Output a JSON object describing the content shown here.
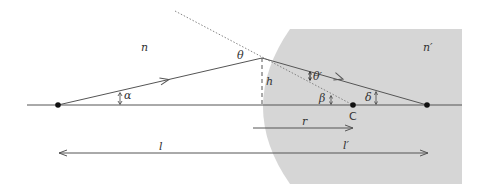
{
  "diagram": {
    "colors": {
      "background": "#ffffff",
      "medium2_fill": "#d6d6d6",
      "line": "#555555",
      "point": "#111111",
      "text": "#333333"
    },
    "media": {
      "left_index": "n",
      "right_index": "n′"
    },
    "angles": {
      "alpha": "α",
      "theta": "θ",
      "theta_prime": "θ′",
      "beta": "β",
      "delta": "δ"
    },
    "points": {
      "center": "C"
    },
    "lengths": {
      "height": "h",
      "radius": "r",
      "object_distance": "l",
      "image_distance": "l′"
    }
  }
}
